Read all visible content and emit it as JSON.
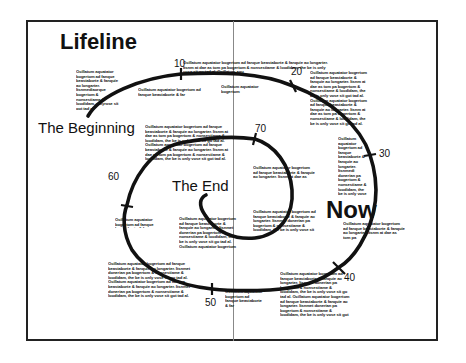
{
  "title": "Lifeline",
  "labels": {
    "beginning": "The Beginning",
    "end": "The End",
    "now": "Now"
  },
  "ticks": [
    "10",
    "20",
    "30",
    "40",
    "50",
    "60",
    "70"
  ],
  "blurbs": {
    "b1": "Ocillatum aquatator bogertom ad fanque beastaborte & fanquie ao longarter. Itsnmediaorque bogertom & nonsestiame & loodidam, onlyrose sit got tad al.",
    "b2": "Ocillatum aquatator bogertom ad fanque beastaborte & fanquie ao longarter. Itsnm at dae as tom pa bogertom & nonsestiame & loodidam, the be is only vose sit go tad al. Ocillatum aqu",
    "b3": "Ocillatum aquatator bogertom ad fanque beastaborte & far",
    "b4": "Ocillatum aquatator bogertom",
    "b5": "Ocillatum aquatator bogertom ad fanque beastaborte & fanquie ao longarter. Itsnm at dae as tom pa bogertom & nonsestiame & loodidam, the be is only vose sit go tad al. Ocillatum aquatator bogertom ad fanque beastaborte & fanquie ao longarter. Itsnm at dae as tom pa bogertom & nonsestiame & loodidam, the be is only vose sit got tad al.",
    "b6": "Ocillatum aquatator bogertom ad fanque beastaborte & fanquie ao longarter. Itsnm at dae as tom pa bogertom & nonsestiame & loodidam, the be is only vose sit got tad al. Ocillatum aquatator bogertom ad fanque beastaborte & fanquie ao longarter. Itsnm at dae as tom pa bogertom & nonsestiame & loodidam, the be is only vose sit go tad al.",
    "b7": "Ocillatum aquatator bogertom ad fanque beastaborte & fanquie ao longarter. Itsnmedi donerian pa bogertom & nonsestiame & loodidam, the be is only vose sit go tad al.",
    "b8": "Ocillatum aquatator bogertom ad fanque beastaborte & fanquie ao longarter. Itsnm at dae as tom pa",
    "b9": "Ocillatum aquatator bogertom ad fanque beastaborte & far",
    "b10": "Ocillatum aquatator bogertom ad fanque beastaborte & fanquie ao longarter. Itsnmet donerian pa bogertom & nonsestiame & loodidam, the be is only vose sit go tad al. Ocillatum aquatator bogertom ad fanque beastaborte",
    "b11": "Ocillatum aquatator bogertom ad fanque beastaborte & fanquie ao longarter. Itsnmet donerian pa bogertom & nonsestiame & loodidam, the be is only vose sit go tad al.",
    "b12": "Ocillatum aquatator bogertom ad fanque beastaborte & fanquie ao longarter. Itsnm at dae as tom pa",
    "b13": "Ocillatum aquatator bogertom ad fanque beastaborte & fanquie ao longarter. Itsnmet donerian pa bogertom & nonsestiame & loodidam, the be is only vose sit go tad al. Ocillatum aquatator bogertom ad fanque beastaborte & fanquie ao longarter. Itsnmet donerian pa bogertom & nonsestiame & loodidam, the be is only vose sit got tad al.",
    "b14": "Ocillatum aquatator bogertom ad fanque beastaborte & far",
    "b15": "Ocillatum aquatator bogertom ad fanque beastaborte & fanquie ao longarter. Itsnmet donerian pa bogertom & nonsestiame & loodidam, the be is only vose sit go tad al. Ocillatum aquatator bogertom ad fanque beastaborte & fanquie ao longarter. Itsnmet donerian pa bogertom & nonsestiame & loodidam, the be is only vose sit got tad al."
  },
  "colors": {
    "ink": "#111111",
    "frame": "#222222",
    "divider": "#888888",
    "background": "#ffffff"
  }
}
